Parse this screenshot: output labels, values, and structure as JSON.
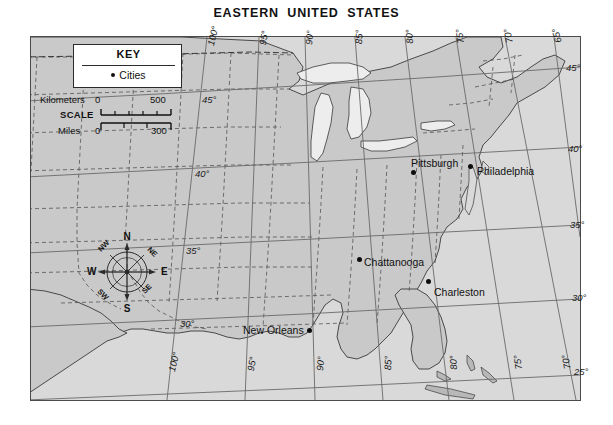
{
  "map": {
    "title": "EASTERN  UNITED  STATES",
    "colors": {
      "land": "#c9c9c9",
      "ocean": "#d9d9d9",
      "lake": "#ededed",
      "border": "#4a4a4a",
      "state_border": "#555555",
      "text": "#111111"
    }
  },
  "key": {
    "title": "KEY",
    "entry_label": "Cities",
    "entry_symbol": "filled-circle"
  },
  "scale": {
    "label": "SCALE",
    "kilometers_label": "Kilometers",
    "kilometers_zero": "0",
    "kilometers_max": "500",
    "miles_label": "Miles",
    "miles_zero": "0",
    "miles_max": "300"
  },
  "compass": {
    "n": "N",
    "ne": "NE",
    "e": "E",
    "se": "SE",
    "s": "S",
    "sw": "SW",
    "w": "W",
    "nw": "NW"
  },
  "cities": [
    {
      "name": "Pittsburgh",
      "label_x": 411,
      "label_y": 157,
      "dot_x": 413,
      "dot_y": 172
    },
    {
      "name": "Philadelphia",
      "label_x": 477,
      "label_y": 165,
      "dot_x": 470,
      "dot_y": 166
    },
    {
      "name": "Chattanooga",
      "label_x": 364,
      "label_y": 256,
      "dot_x": 359,
      "dot_y": 259
    },
    {
      "name": "Charleston",
      "label_x": 434,
      "label_y": 286,
      "dot_x": 428,
      "dot_y": 281
    },
    {
      "name": "New Orleans",
      "label_x": 243,
      "label_y": 324,
      "dot_x": 309,
      "dot_y": 330
    }
  ],
  "graticule": {
    "longitudes_top": [
      {
        "label": "100°",
        "x": 205,
        "y": 44,
        "rot": -76
      },
      {
        "label": "95°",
        "x": 257,
        "y": 44,
        "rot": -80
      },
      {
        "label": "90°",
        "x": 303,
        "y": 44,
        "rot": -84
      },
      {
        "label": "85°",
        "x": 353,
        "y": 44,
        "rot": -88
      },
      {
        "label": "80°",
        "x": 404,
        "y": 44,
        "rot": -93
      },
      {
        "label": "75°",
        "x": 455,
        "y": 44,
        "rot": -97
      },
      {
        "label": "70°",
        "x": 504,
        "y": 44,
        "rot": -101
      },
      {
        "label": "65°",
        "x": 553,
        "y": 44,
        "rot": -105
      }
    ],
    "longitudes_bottom": [
      {
        "label": "100°",
        "x": 166,
        "y": 370,
        "rot": -76
      },
      {
        "label": "95°",
        "x": 245,
        "y": 370,
        "rot": -80
      },
      {
        "label": "90°",
        "x": 314,
        "y": 370,
        "rot": -84
      },
      {
        "label": "85°",
        "x": 382,
        "y": 370,
        "rot": -88
      },
      {
        "label": "80°",
        "x": 448,
        "y": 370,
        "rot": -93
      },
      {
        "label": "75°",
        "x": 513,
        "y": 370,
        "rot": -97
      },
      {
        "label": "70°",
        "x": 562,
        "y": 370,
        "rot": -101
      }
    ],
    "latitudes_left": [
      {
        "label": "45°",
        "x": 202,
        "y": 94
      },
      {
        "label": "40°",
        "x": 195,
        "y": 168
      },
      {
        "label": "35°",
        "x": 186,
        "y": 245
      },
      {
        "label": "30°",
        "x": 180,
        "y": 318
      }
    ],
    "latitudes_right": [
      {
        "label": "45°",
        "x": 566,
        "y": 62
      },
      {
        "label": "40°",
        "x": 568,
        "y": 143
      },
      {
        "label": "35°",
        "x": 570,
        "y": 219
      },
      {
        "label": "30°",
        "x": 572,
        "y": 292
      },
      {
        "label": "25°",
        "x": 574,
        "y": 366
      }
    ]
  }
}
